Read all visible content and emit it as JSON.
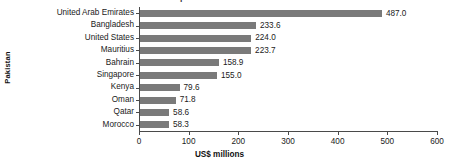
{
  "chart_data": {
    "type": "bar",
    "orientation": "horizontal",
    "title": "Pakistan's top investment destinations 2017-8: OFDI UNCTAD data",
    "title_clipped": true,
    "xlabel": "US$ millions",
    "ylabel": "Pakistan",
    "categories": [
      "United Arab Emirates",
      "Bangladesh",
      "United States",
      "Mauritius",
      "Bahrain",
      "Singapore",
      "Kenya",
      "Oman",
      "Qatar",
      "Morocco"
    ],
    "values": [
      487.0,
      233.6,
      224.0,
      223.7,
      158.9,
      155.0,
      79.6,
      71.8,
      58.6,
      58.3
    ],
    "value_labels": [
      "487.0",
      "233.6",
      "224.0",
      "223.7",
      "158.9",
      "155.0",
      "79.6",
      "71.8",
      "58.6",
      "58.3"
    ],
    "xlim": [
      0,
      600
    ],
    "xticks": [
      0,
      100,
      200,
      300,
      400,
      500,
      600
    ],
    "xtick_labels": [
      "0",
      "100",
      "200",
      "300",
      "400",
      "500",
      "600"
    ],
    "grid": false,
    "legend": false,
    "bar_color": "#7a7a7a",
    "axis_color": "#4a4a4a",
    "background": "#ffffff"
  }
}
